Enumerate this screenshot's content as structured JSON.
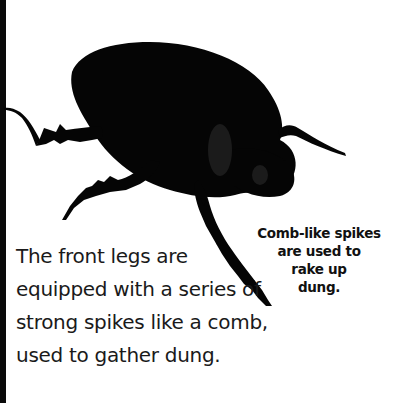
{
  "page": {
    "image": {
      "subject": "dung beetle silhouette",
      "alt": "Black dung beetle seen from the side with spiky front legs"
    },
    "body_text": {
      "lines": [
        "The front legs are",
        "equipped with a series of",
        "strong spikes like a comb,",
        "used to gather dung."
      ]
    },
    "caption": {
      "lines": [
        "Comb-like spikes",
        "are used to",
        "rake up",
        "dung."
      ]
    },
    "colors": {
      "background": "#ffffff",
      "ink": "#0a0a0a",
      "text": "#1a1a1a"
    }
  }
}
